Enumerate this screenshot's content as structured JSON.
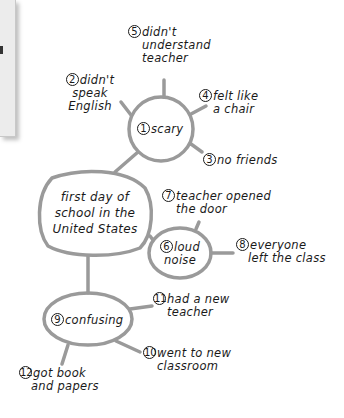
{
  "diagram": {
    "type": "cluster-map",
    "line_color": "#9a9a9a",
    "text_color": "#1a1a1a",
    "center": {
      "label": "first day of school in the United States",
      "lines": [
        "first day of",
        "school in the",
        "United States"
      ]
    },
    "nodes": [
      {
        "number": "1",
        "label": "scary",
        "lines": [
          "scary"
        ],
        "parent": "center"
      },
      {
        "number": "2",
        "label": "didn't speak English",
        "lines": [
          "didn't",
          "speak",
          "English"
        ],
        "parent": "1"
      },
      {
        "number": "3",
        "label": "no friends",
        "lines": [
          "no friends"
        ],
        "parent": "1"
      },
      {
        "number": "4",
        "label": "felt like a chair",
        "lines": [
          "felt like",
          "a chair"
        ],
        "parent": "1"
      },
      {
        "number": "5",
        "label": "didn't understand teacher",
        "lines": [
          "didn't",
          "understand",
          "teacher"
        ],
        "parent": "1"
      },
      {
        "number": "6",
        "label": "loud noise",
        "lines": [
          "loud",
          "noise"
        ],
        "parent": "center"
      },
      {
        "number": "7",
        "label": "teacher opened the door",
        "lines": [
          "teacher opened",
          "the door"
        ],
        "parent": "6"
      },
      {
        "number": "8",
        "label": "everyone left the class",
        "lines": [
          "everyone",
          "left the class"
        ],
        "parent": "6"
      },
      {
        "number": "9",
        "label": "confusing",
        "lines": [
          "confusing"
        ],
        "parent": "center"
      },
      {
        "number": "10",
        "label": "went to new classroom",
        "lines": [
          "went to new",
          "classroom"
        ],
        "parent": "9"
      },
      {
        "number": "11",
        "label": "had a new teacher",
        "lines": [
          "had a new",
          "teacher"
        ],
        "parent": "9"
      },
      {
        "number": "12",
        "label": "got book and papers",
        "lines": [
          "got book",
          "and papers"
        ],
        "parent": "9"
      }
    ]
  }
}
